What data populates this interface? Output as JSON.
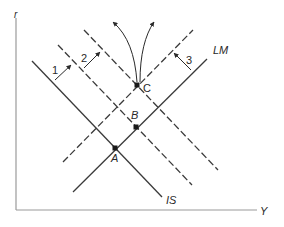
{
  "diagram": {
    "type": "IS-LM shift diagram",
    "axes": {
      "y_label": "r",
      "x_label": "Y"
    },
    "curves": {
      "is_label": "IS",
      "lm_label": "LM"
    },
    "points": [
      {
        "id": "A",
        "label": "A"
      },
      {
        "id": "B",
        "label": "B"
      },
      {
        "id": "C",
        "label": "C"
      }
    ],
    "shift_arrows": [
      {
        "id": "1",
        "label": "1"
      },
      {
        "id": "2",
        "label": "2"
      },
      {
        "id": "3",
        "label": "3"
      }
    ],
    "colors": {
      "line": "#3a3a3a",
      "axis": "#9a9a9a",
      "background": "#ffffff"
    }
  }
}
